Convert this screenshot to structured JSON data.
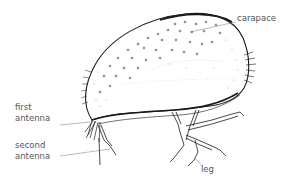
{
  "diagram": {
    "labels": {
      "carapace": "carapace",
      "first_antenna_line1": "first",
      "first_antenna_line2": "antenna",
      "second_antenna_line1": "second",
      "second_antenna_line2": "antenna",
      "leg": "leg"
    },
    "colors": {
      "ink": "#1a1a1a",
      "label_text": "#555555",
      "leader_line": "#777777",
      "background": "#ffffff"
    }
  }
}
